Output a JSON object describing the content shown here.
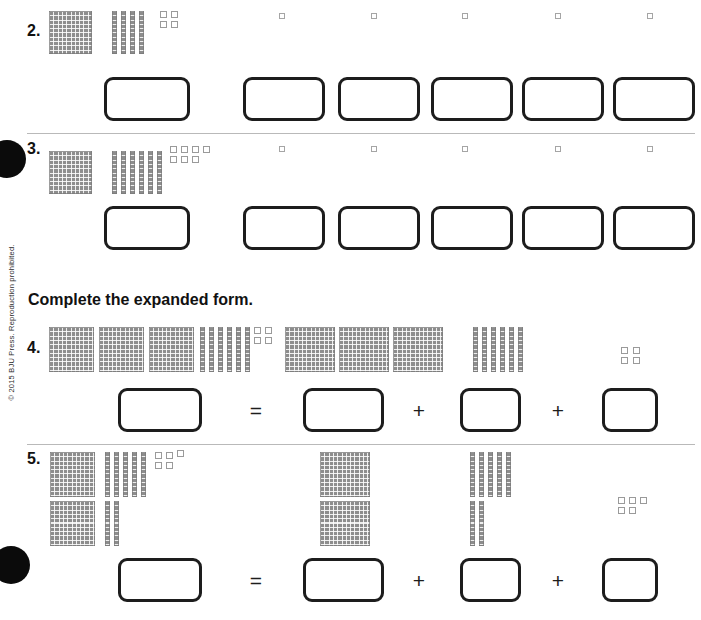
{
  "page": {
    "width": 701,
    "height": 620,
    "copyright": "© 2015 BJU Press. Reproduction prohibited.",
    "background_color": "#ffffff",
    "rule_color": "#b9b9b9",
    "block_color": "#8d8d8d",
    "box_border_color": "#1d1d1d",
    "bullet_color": "#0b0b0b"
  },
  "instructions": {
    "expanded_form": "Complete the expanded form."
  },
  "operators": {
    "equals": "=",
    "plus": "+"
  },
  "problems": [
    {
      "number": "2.",
      "type": "place-value-write",
      "blocks": {
        "hundreds": 1,
        "tens": 4,
        "ones": 4
      },
      "value": 144,
      "answer_boxes": 6,
      "marker_units": 5
    },
    {
      "number": "3.",
      "type": "place-value-write",
      "blocks": {
        "hundreds": 1,
        "tens": 6,
        "ones": 7
      },
      "value": 167,
      "answer_boxes": 6,
      "marker_units": 5
    },
    {
      "number": "4.",
      "type": "expanded-form",
      "blocks": {
        "hundreds": 3,
        "tens": 6,
        "ones": 4
      },
      "value": 364,
      "terms": [
        {
          "blocks": {
            "hundreds": 3,
            "tens": 0,
            "ones": 0
          },
          "value": 300
        },
        {
          "blocks": {
            "hundreds": 0,
            "tens": 6,
            "ones": 0
          },
          "value": 60
        },
        {
          "blocks": {
            "hundreds": 0,
            "tens": 0,
            "ones": 4
          },
          "value": 4
        }
      ],
      "answer_boxes": 4
    },
    {
      "number": "5.",
      "type": "expanded-form",
      "blocks": {
        "hundreds": 2,
        "tens": 7,
        "ones": 5
      },
      "value": 275,
      "terms": [
        {
          "blocks": {
            "hundreds": 2,
            "tens": 0,
            "ones": 0
          },
          "value": 200
        },
        {
          "blocks": {
            "hundreds": 0,
            "tens": 7,
            "ones": 0
          },
          "value": 70
        },
        {
          "blocks": {
            "hundreds": 0,
            "tens": 0,
            "ones": 5
          },
          "value": 5
        }
      ],
      "answer_boxes": 4
    }
  ]
}
